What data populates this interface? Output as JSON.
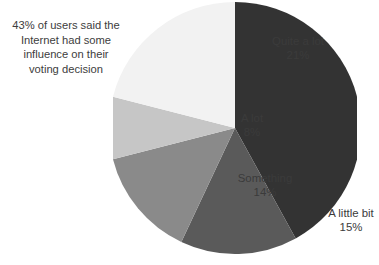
{
  "annotation": {
    "lines": [
      "43% of users said the",
      "Internet had some",
      "influence on their",
      "voting decision"
    ]
  },
  "chart_data": {
    "type": "pie",
    "title": "",
    "labels": [
      "Nothing",
      "A little bit",
      "Something",
      "A lot",
      "Quite a lot"
    ],
    "values": [
      42,
      15,
      14,
      8,
      21
    ],
    "value_suffix": "%",
    "value_labels": [
      "42%",
      "15%",
      "14%",
      "8%",
      "21%"
    ],
    "colors": [
      "#333333",
      "#5a5a5a",
      "#8a8a8a",
      "#c6c6c6",
      "#f2f2f2"
    ],
    "label_text_colors": [
      "#ffffff",
      "#3b3b3b",
      "#3b3b3b",
      "#3b3b3b",
      "#3b3b3b"
    ],
    "start_angle_deg": 0,
    "direction": "clockwise",
    "legend": "none",
    "grid": false,
    "annotation": "43% of users said the Internet had some influence on their voting decision",
    "slices": [
      {
        "label": "Nothing",
        "value": 42,
        "display": "42%",
        "color": "#333333"
      },
      {
        "label": "A little bit",
        "value": 15,
        "display": "15%",
        "color": "#5a5a5a"
      },
      {
        "label": "Something",
        "value": 14,
        "display": "14%",
        "color": "#8a8a8a"
      },
      {
        "label": "A lot",
        "value": 8,
        "display": "8%",
        "color": "#c6c6c6"
      },
      {
        "label": "Quite a lot",
        "value": 21,
        "display": "21%",
        "color": "#f2f2f2"
      }
    ]
  }
}
